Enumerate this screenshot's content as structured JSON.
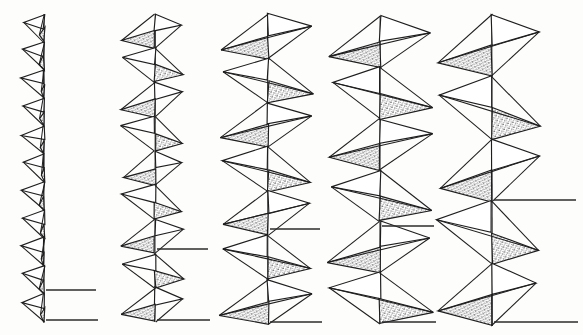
{
  "figure": {
    "title": "",
    "background_color": "#fdfdfc",
    "ink_color": "#1e1e1e",
    "stipple_color": "#2a2a2a",
    "paper_note": "scanned line-drawing plate, no caption text visible",
    "column_count": 5,
    "reference_line_count_per_column": 2
  },
  "chart_data": {
    "type": "line",
    "title": "",
    "subtitle": "",
    "xlabel": "",
    "ylabel": "",
    "grid": false,
    "legend": "none",
    "categories": [
      "1",
      "2",
      "3",
      "4",
      "5"
    ],
    "series": [
      {
        "name": "units_per_column",
        "values": [
          11,
          9,
          7,
          6,
          5
        ]
      },
      {
        "name": "amplitude_left_px",
        "values": [
          24,
          38,
          52,
          56,
          60
        ]
      },
      {
        "name": "amplitude_right_px",
        "values": [
          4,
          30,
          48,
          56,
          52
        ]
      },
      {
        "name": "unit_pitch_px",
        "values": [
          28,
          34,
          44,
          52,
          58
        ]
      },
      {
        "name": "axis_x_px",
        "values": [
          44,
          155,
          268,
          380,
          492
        ]
      }
    ],
    "xlim": [
      0,
      583
    ],
    "ylim": [
      0,
      335
    ]
  },
  "columns": [
    {
      "id": "column-1",
      "label": "1",
      "axis_x": 44,
      "axis_top": 14,
      "axis_bottom": 322,
      "units": 11,
      "pitch": 28,
      "amp_left": 24,
      "amp_right": 4,
      "ref_lines": [
        {
          "y": 290,
          "x_start": 46,
          "x_end": 96
        },
        {
          "y": 320,
          "x_start": 46,
          "x_end": 98
        }
      ]
    },
    {
      "id": "column-2",
      "label": "2",
      "axis_x": 155,
      "axis_top": 14,
      "axis_bottom": 322,
      "units": 9,
      "pitch": 34,
      "amp_left": 38,
      "amp_right": 30,
      "ref_lines": [
        {
          "y": 249,
          "x_start": 157,
          "x_end": 208
        },
        {
          "y": 320,
          "x_start": 157,
          "x_end": 210
        }
      ]
    },
    {
      "id": "column-3",
      "label": "3",
      "axis_x": 268,
      "axis_top": 14,
      "axis_bottom": 324,
      "units": 7,
      "pitch": 44,
      "amp_left": 52,
      "amp_right": 48,
      "ref_lines": [
        {
          "y": 229,
          "x_start": 270,
          "x_end": 320
        },
        {
          "y": 322,
          "x_start": 270,
          "x_end": 322
        }
      ]
    },
    {
      "id": "column-4",
      "label": "4",
      "axis_x": 380,
      "axis_top": 16,
      "axis_bottom": 324,
      "units": 6,
      "pitch": 52,
      "amp_left": 56,
      "amp_right": 56,
      "ref_lines": [
        {
          "y": 226,
          "x_start": 382,
          "x_end": 434
        },
        {
          "y": 322,
          "x_start": 382,
          "x_end": 436
        }
      ]
    },
    {
      "id": "column-5",
      "label": "5",
      "axis_x": 492,
      "axis_top": 14,
      "axis_bottom": 326,
      "units": 5,
      "pitch": 58,
      "amp_left": 60,
      "amp_right": 52,
      "ref_lines": [
        {
          "y": 200,
          "x_start": 494,
          "x_end": 576
        },
        {
          "y": 322,
          "x_start": 494,
          "x_end": 578
        }
      ]
    }
  ]
}
